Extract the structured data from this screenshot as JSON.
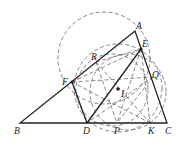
{
  "diagram": {
    "type": "geometry",
    "points": {
      "A": {
        "label": "A",
        "x": 135,
        "y": 31
      },
      "B": {
        "label": "B",
        "x": 20,
        "y": 123
      },
      "C": {
        "label": "C",
        "x": 167,
        "y": 123
      },
      "D": {
        "label": "D",
        "x": 87,
        "y": 123
      },
      "E": {
        "label": "E",
        "x": 141,
        "y": 49
      },
      "F": {
        "label": "F",
        "x": 72,
        "y": 82
      },
      "P": {
        "label": "P",
        "x": 117,
        "y": 123
      },
      "K": {
        "label": "K",
        "x": 150,
        "y": 123
      },
      "Q": {
        "label": "Q",
        "x": 153,
        "y": 77
      },
      "R": {
        "label": "R",
        "x": 96,
        "y": 62
      },
      "I": {
        "label": "I",
        "x": 118,
        "y": 89
      }
    },
    "labels": {
      "A": "A",
      "B": "B",
      "C": "C",
      "D": "D",
      "E": "E",
      "F": "F",
      "P": "P",
      "K": "K",
      "Q": "Q",
      "R": "R",
      "I": "I"
    }
  }
}
